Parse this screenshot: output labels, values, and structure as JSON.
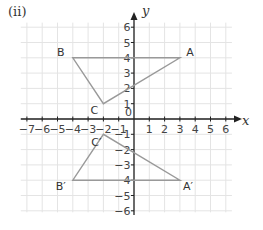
{
  "part_label": "(ii)",
  "axes": {
    "x_label": "x",
    "y_label": "y",
    "origin_label": "0",
    "x_ticks": [
      -7,
      -6,
      -5,
      -4,
      -3,
      -2,
      -1,
      1,
      2,
      3,
      4,
      5,
      6
    ],
    "y_ticks": [
      6,
      5,
      4,
      3,
      2,
      1,
      -1,
      -2,
      -3,
      -4,
      -5,
      -6
    ],
    "xlim": [
      -7,
      6
    ],
    "ylim": [
      -6,
      6
    ]
  },
  "colors": {
    "grid": "#e4e4e4",
    "axis": "#222222",
    "shape": "#999999",
    "text": "#333333"
  },
  "chart_data": {
    "type": "diagram",
    "title": "(ii)",
    "xlabel": "x",
    "ylabel": "y",
    "xlim": [
      -7,
      6
    ],
    "ylim": [
      -6,
      6
    ],
    "grid": true,
    "shapes": [
      {
        "name": "Triangle ABC",
        "points": [
          {
            "label": "A",
            "x": 3,
            "y": 4
          },
          {
            "label": "B",
            "x": -4,
            "y": 4
          },
          {
            "label": "C",
            "x": -2,
            "y": 1
          }
        ]
      },
      {
        "name": "Triangle A'B'C'",
        "points": [
          {
            "label": "A′",
            "x": 3,
            "y": -4
          },
          {
            "label": "B′",
            "x": -4,
            "y": -4
          },
          {
            "label": "C′",
            "x": -2,
            "y": -1
          }
        ]
      }
    ]
  }
}
